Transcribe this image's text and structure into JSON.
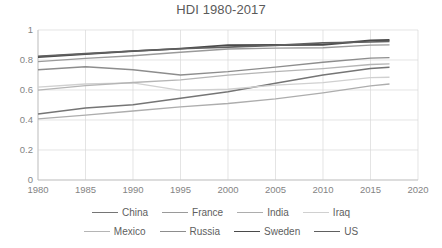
{
  "chart_data": {
    "type": "line",
    "title": "HDI 1980-2017",
    "xlabel": "",
    "ylabel": "",
    "xlim": [
      1980,
      2020
    ],
    "ylim": [
      0,
      1
    ],
    "xticks": [
      "1980",
      "1985",
      "1990",
      "1995",
      "2000",
      "2005",
      "2010",
      "2015",
      "2020"
    ],
    "yticks": [
      "0",
      "0.2",
      "0.4",
      "0.6",
      "0.8",
      "1"
    ],
    "grid": true,
    "legend_position": "bottom",
    "x": [
      1980,
      1985,
      1990,
      1995,
      2000,
      2005,
      2010,
      2015,
      2017
    ],
    "series": [
      {
        "name": "China",
        "color": "#757575",
        "width": 1.5,
        "values": [
          0.44,
          0.48,
          0.502,
          0.545,
          0.589,
          0.645,
          0.7,
          0.743,
          0.752
        ]
      },
      {
        "name": "France",
        "color": "#9a9a9a",
        "width": 1.4,
        "values": [
          0.789,
          0.811,
          0.828,
          0.852,
          0.873,
          0.879,
          0.882,
          0.899,
          0.901
        ]
      },
      {
        "name": "India",
        "color": "#adadad",
        "width": 1.3,
        "values": [
          0.408,
          0.433,
          0.46,
          0.488,
          0.51,
          0.541,
          0.581,
          0.627,
          0.64
        ]
      },
      {
        "name": "Iraq",
        "color": "#d0d0d0",
        "width": 1.3,
        "values": [
          0.619,
          0.64,
          0.648,
          0.598,
          0.605,
          0.632,
          0.649,
          0.682,
          0.685
        ]
      },
      {
        "name": "Mexico",
        "color": "#b5b5b5",
        "width": 1.3,
        "values": [
          0.599,
          0.629,
          0.65,
          0.668,
          0.699,
          0.723,
          0.743,
          0.77,
          0.774
        ]
      },
      {
        "name": "Russia",
        "color": "#8d8d8d",
        "width": 1.3,
        "values": [
          0.735,
          0.755,
          0.735,
          0.7,
          0.722,
          0.752,
          0.785,
          0.813,
          0.816
        ]
      },
      {
        "name": "Sweden",
        "color": "#4a4a4a",
        "width": 1.9,
        "values": [
          0.82,
          0.839,
          0.859,
          0.876,
          0.899,
          0.9,
          0.902,
          0.93,
          0.933
        ]
      },
      {
        "name": "US",
        "color": "#606060",
        "width": 1.7,
        "values": [
          0.825,
          0.843,
          0.86,
          0.875,
          0.886,
          0.897,
          0.914,
          0.92,
          0.924
        ]
      }
    ]
  },
  "legend": {
    "row1": [
      {
        "label": "China"
      },
      {
        "label": "France"
      },
      {
        "label": "India"
      },
      {
        "label": "Iraq"
      }
    ],
    "row2": [
      {
        "label": "Mexico"
      },
      {
        "label": "Russia"
      },
      {
        "label": "Sweden"
      },
      {
        "label": "US"
      }
    ]
  }
}
